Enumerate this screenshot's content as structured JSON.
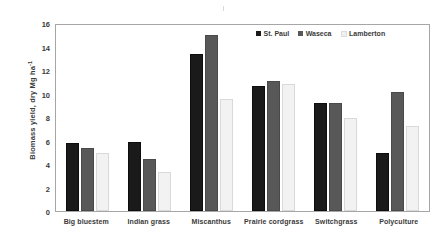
{
  "chart_data": {
    "type": "bar",
    "title": "",
    "xlabel": "",
    "ylabel": "Biomass yield, dry Mg ha",
    "ylabel_superscript": "-1",
    "ylim": [
      0,
      16
    ],
    "yticks": [
      16,
      14,
      12,
      10,
      8,
      6,
      4,
      2,
      0
    ],
    "grid": false,
    "legend_position": "top-right",
    "categories": [
      "Big bluestem",
      "Indian grass",
      "Miscanthus",
      "Prairie cordgrass",
      "Switchgrass",
      "Polyculture"
    ],
    "series": [
      {
        "name": "St. Paul",
        "color": "#1a1a1a",
        "values": [
          5.8,
          5.9,
          13.4,
          10.6,
          9.2,
          4.9
        ]
      },
      {
        "name": "Waseca",
        "color": "#585858",
        "values": [
          5.4,
          4.4,
          15.0,
          11.1,
          9.2,
          10.1
        ]
      },
      {
        "name": "Lamberton",
        "color": "#f2f2f2",
        "values": [
          4.9,
          3.3,
          9.5,
          10.8,
          7.9,
          7.2
        ]
      }
    ]
  }
}
